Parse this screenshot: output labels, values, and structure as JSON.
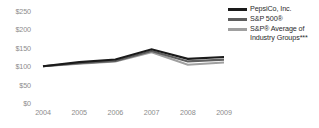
{
  "chart_data": {
    "type": "line",
    "title": "",
    "subtitle": "",
    "xlabel": "",
    "ylabel": "",
    "x": [
      "2004",
      "2005",
      "2006",
      "2007",
      "2008",
      "2009"
    ],
    "categories": [
      "2004",
      "2005",
      "2006",
      "2007",
      "2008",
      "2009"
    ],
    "ylim": [
      0,
      250
    ],
    "y_ticks": [
      0,
      50,
      100,
      150,
      200,
      250
    ],
    "y_tick_labels": [
      "$0",
      "$50",
      "$100",
      "$150",
      "$200",
      "$250"
    ],
    "x_tick_labels": [
      "2004",
      "2005",
      "2006",
      "2007",
      "2008",
      "2009"
    ],
    "grid": false,
    "legend_position": "top-right",
    "series": [
      {
        "name": "PepsiCo, Inc.",
        "color": "#1a1a1a",
        "values": [
          100,
          111,
          118,
          146,
          120,
          125
        ]
      },
      {
        "name": "S&P 500®",
        "color": "#5e5e5e",
        "values": [
          100,
          108,
          114,
          141,
          113,
          118
        ]
      },
      {
        "name": "S&P® Average of Industry Groups***",
        "color": "#a0a0a0",
        "values": [
          100,
          107,
          113,
          138,
          104,
          110
        ]
      }
    ]
  },
  "legend": {
    "items": [
      {
        "label": "PepsiCo, Inc."
      },
      {
        "label": "S&P 500®"
      },
      {
        "label": "S&P® Average of Industry Groups***"
      }
    ]
  }
}
